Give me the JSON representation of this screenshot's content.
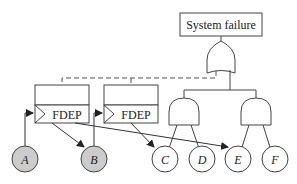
{
  "diagram": {
    "type": "dynamic fault tree",
    "top_event": {
      "label": "System failure"
    },
    "gates": [
      {
        "id": "or-top",
        "type": "OR",
        "output": "System failure",
        "inputs": [
          "and-1",
          "and-2"
        ]
      },
      {
        "id": "and-1",
        "type": "AND",
        "inputs": [
          "C",
          "D"
        ]
      },
      {
        "id": "and-2",
        "type": "AND",
        "inputs": [
          "E",
          "F"
        ]
      },
      {
        "id": "fdep-1",
        "type": "FDEP",
        "label": "FDEP",
        "trigger": "A",
        "dependents": [
          "B",
          "E"
        ]
      },
      {
        "id": "fdep-2",
        "type": "FDEP",
        "label": "FDEP",
        "trigger": "B",
        "dependents": [
          "C"
        ]
      }
    ],
    "basic_events": [
      {
        "id": "A",
        "label": "A",
        "shaded": true
      },
      {
        "id": "B",
        "label": "B",
        "shaded": true
      },
      {
        "id": "C",
        "label": "C",
        "shaded": false
      },
      {
        "id": "D",
        "label": "D",
        "shaded": false
      },
      {
        "id": "E",
        "label": "E",
        "shaded": false
      },
      {
        "id": "F",
        "label": "F",
        "shaded": false
      }
    ],
    "colors": {
      "line": "#333333",
      "shaded_fill": "#cccccc",
      "background": "#ffffff"
    }
  }
}
